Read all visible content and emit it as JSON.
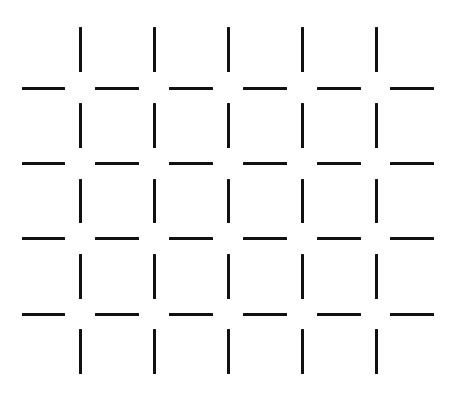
{
  "figure": {
    "type": "illusory-grid-line-segments",
    "background_color": "#ffffff",
    "line_color": "#111111",
    "line_thickness": 3,
    "vertical_segments": {
      "columns_x": [
        80,
        154,
        228,
        302,
        376
      ],
      "rows_y_ranges": [
        [
          27,
          72
        ],
        [
          103,
          148
        ],
        [
          179,
          223
        ],
        [
          254,
          299
        ],
        [
          329,
          374
        ]
      ]
    },
    "horizontal_segments": {
      "rows_y": [
        88,
        163,
        238,
        314
      ],
      "columns_x_ranges": [
        [
          22,
          65
        ],
        [
          95,
          139
        ],
        [
          169,
          213
        ],
        [
          243,
          287
        ],
        [
          317,
          361
        ],
        [
          390,
          434
        ]
      ]
    }
  }
}
